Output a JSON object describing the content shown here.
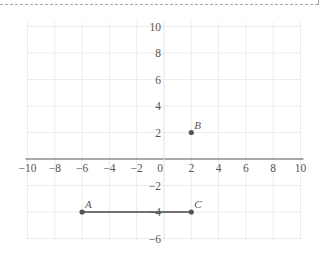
{
  "chart_data": {
    "type": "scatter",
    "title": "",
    "xlabel": "",
    "ylabel": "",
    "xlim": [
      -10,
      10
    ],
    "ylim": [
      -6,
      10
    ],
    "grid": true,
    "x_ticks": [
      -10,
      -8,
      -6,
      -4,
      -2,
      0,
      2,
      4,
      6,
      8,
      10
    ],
    "y_ticks": [
      10,
      8,
      6,
      4,
      2,
      -2,
      -4,
      -6
    ],
    "x_tick_labels": [
      "−10",
      "−8",
      "−6",
      "−4",
      "−2",
      "0",
      "2",
      "4",
      "6",
      "8",
      "10"
    ],
    "y_tick_labels": [
      "10",
      "8",
      "6",
      "4",
      "2",
      "−2",
      "−4",
      "−6"
    ],
    "points": [
      {
        "label": "A",
        "x": -6,
        "y": -4
      },
      {
        "label": "B",
        "x": 2,
        "y": 2
      },
      {
        "label": "C",
        "x": 2,
        "y": -4
      }
    ],
    "segments": [
      {
        "from": "A",
        "to": "C"
      }
    ],
    "colors": {
      "grid": "#ececec",
      "axis": "#555555",
      "point": "#555555",
      "segment": "#444444"
    }
  }
}
